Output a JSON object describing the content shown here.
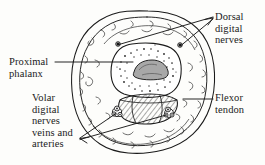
{
  "figure": {
    "kind": "anatomical-cross-section",
    "width": 265,
    "height": 165,
    "background_color": "#fdfdfb",
    "ink_color": "#1a1a1a"
  },
  "labels": {
    "dorsal_digital_nerves": "Dorsal\ndigital\nnerves",
    "proximal_phalanx": "Proximal\nphalanx",
    "volar_digital_nerves": "Volar\ndigital\nnerves\nveins and\narteries",
    "flexor_tendon": "Flexor\ntendon"
  },
  "structures": [
    {
      "name": "skin-outer-boundary",
      "description": "outer hand-drawn skin outline of the digit"
    },
    {
      "name": "subcutaneous-layer",
      "description": "inner concentric outline enclosing fatty subcutaneous tissue"
    },
    {
      "name": "fat-septa",
      "description": "short squiggled strokes representing fibrofatty septa"
    },
    {
      "name": "proximal-phalanx",
      "description": "central rounded-square bone with stippled cortex"
    },
    {
      "name": "bone-marrow",
      "description": "shaded medullary cavity inside the phalanx"
    },
    {
      "name": "flexor-tendon",
      "description": "hatched lens-shaped tendon volar to the bone"
    },
    {
      "name": "volar-bundle-left",
      "description": "cluster of vessels and nerve at volar-radial corner"
    },
    {
      "name": "volar-bundle-right",
      "description": "cluster of vessels and nerve at volar-ulnar corner"
    },
    {
      "name": "dorsal-nerve-left",
      "description": "small dark dot marking the left dorsal digital nerve"
    },
    {
      "name": "dorsal-nerve-right",
      "description": "small dark dot marking the right dorsal digital nerve"
    }
  ],
  "leaders": [
    {
      "name": "leader-dorsal-left",
      "from": "dorsal-nerve-left",
      "to": "dorsal_digital_nerves"
    },
    {
      "name": "leader-dorsal-right",
      "from": "dorsal-nerve-right",
      "to": "dorsal_digital_nerves"
    },
    {
      "name": "leader-proximal",
      "from": "proximal-phalanx",
      "to": "proximal_phalanx"
    },
    {
      "name": "leader-flexor",
      "from": "flexor-tendon",
      "to": "flexor_tendon"
    },
    {
      "name": "leader-volar-left",
      "from": "volar-bundle-left",
      "to": "volar_digital_nerves"
    },
    {
      "name": "leader-volar-right",
      "from": "volar-bundle-right",
      "to": "volar_digital_nerves"
    }
  ]
}
